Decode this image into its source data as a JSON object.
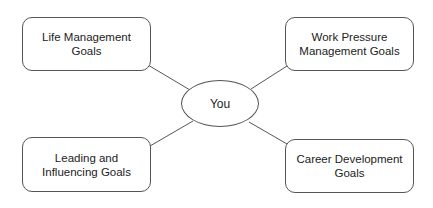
{
  "diagram": {
    "type": "mind-map",
    "center": {
      "label": "You"
    },
    "nodes": [
      {
        "id": "top-left",
        "label": "Life Management Goals"
      },
      {
        "id": "top-right",
        "label": "Work Pressure Management Goals"
      },
      {
        "id": "bottom-left",
        "label": "Leading and Influencing Goals"
      },
      {
        "id": "bottom-right",
        "label": "Career Development Goals"
      }
    ],
    "edges": [
      {
        "from": "You",
        "to": "Life Management Goals"
      },
      {
        "from": "You",
        "to": "Work Pressure Management Goals"
      },
      {
        "from": "You",
        "to": "Leading and Influencing Goals"
      },
      {
        "from": "You",
        "to": "Career Development Goals"
      }
    ],
    "colors": {
      "stroke": "#555555",
      "background": "#ffffff",
      "text": "#222222"
    }
  }
}
